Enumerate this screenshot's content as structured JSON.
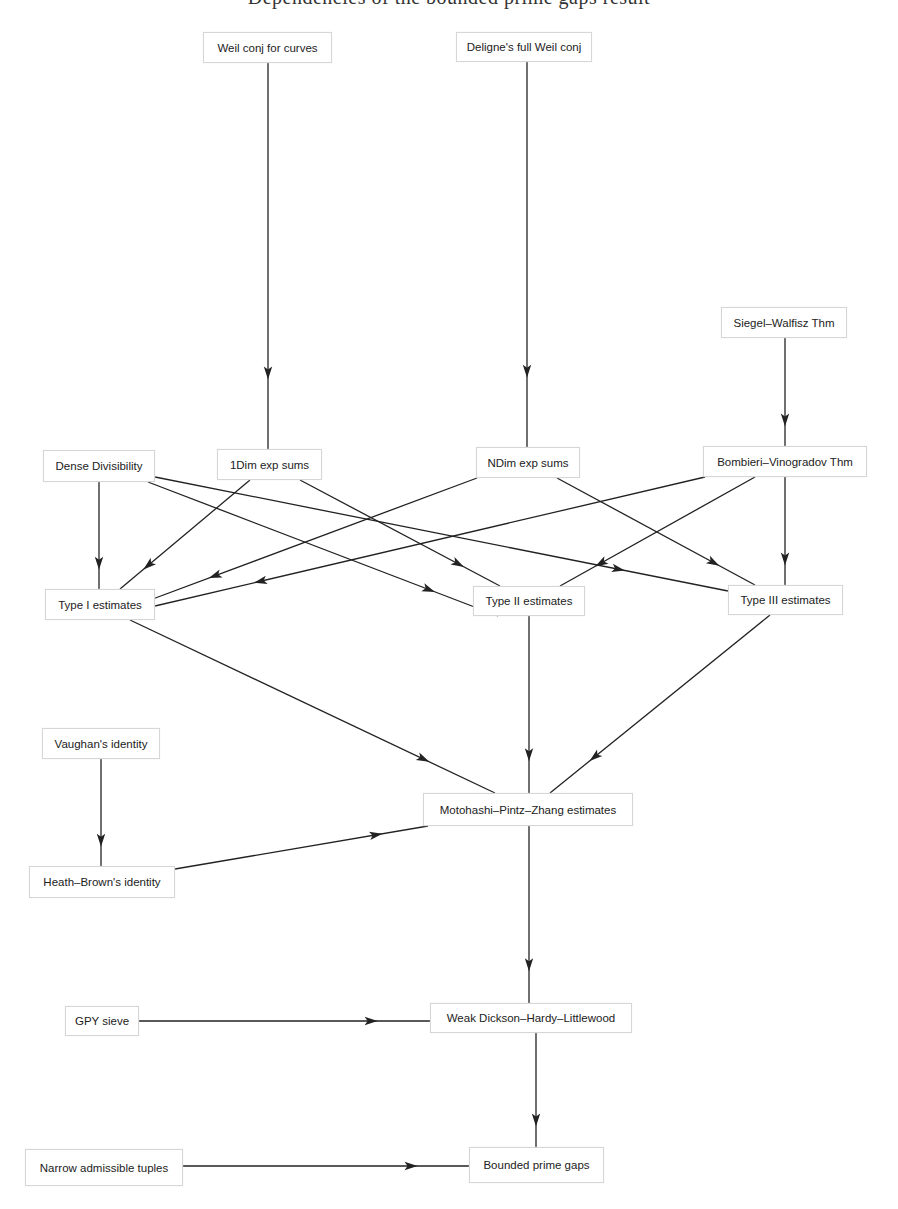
{
  "header": {
    "clipped_title": "Dependencies of the bounded prime gaps result"
  },
  "colors": {
    "edge": "#222222",
    "node_border": "#d6d6d6",
    "text": "#222222"
  },
  "nodes": [
    {
      "id": "weil_curves",
      "label": "Weil conj for curves",
      "x": 203,
      "y": 32,
      "w": 129,
      "h": 31
    },
    {
      "id": "deligne",
      "label": "Deligne's full Weil conj",
      "x": 456,
      "y": 32,
      "w": 136,
      "h": 30
    },
    {
      "id": "siegel",
      "label": "Siegel–Walfisz Thm",
      "x": 721,
      "y": 307,
      "w": 126,
      "h": 31
    },
    {
      "id": "dense",
      "label": "Dense Divisibility",
      "x": 43,
      "y": 450,
      "w": 112,
      "h": 32
    },
    {
      "id": "oned",
      "label": "1Dim exp sums",
      "x": 217,
      "y": 449,
      "w": 105,
      "h": 31
    },
    {
      "id": "nd",
      "label": "NDim exp sums",
      "x": 476,
      "y": 447,
      "w": 104,
      "h": 31
    },
    {
      "id": "bv",
      "label": "Bombieri–Vinogradov Thm",
      "x": 703,
      "y": 446,
      "w": 164,
      "h": 31
    },
    {
      "id": "t1",
      "label": "Type I estimates",
      "x": 45,
      "y": 589,
      "w": 110,
      "h": 31
    },
    {
      "id": "t2",
      "label": "Type II estimates",
      "x": 473,
      "y": 586,
      "w": 112,
      "h": 30
    },
    {
      "id": "t3",
      "label": "Type III estimates",
      "x": 728,
      "y": 585,
      "w": 115,
      "h": 30
    },
    {
      "id": "vaughan",
      "label": "Vaughan's identity",
      "x": 42,
      "y": 728,
      "w": 118,
      "h": 31
    },
    {
      "id": "mpz",
      "label": "Motohashi–Pintz–Zhang estimates",
      "x": 423,
      "y": 793,
      "w": 210,
      "h": 33
    },
    {
      "id": "hb",
      "label": "Heath–Brown's identity",
      "x": 29,
      "y": 866,
      "w": 146,
      "h": 32
    },
    {
      "id": "gpy",
      "label": "GPY sieve",
      "x": 65,
      "y": 1006,
      "w": 74,
      "h": 30
    },
    {
      "id": "dhl",
      "label": "Weak Dickson–Hardy–Littlewood",
      "x": 430,
      "y": 1003,
      "w": 202,
      "h": 30
    },
    {
      "id": "narrow",
      "label": "Narrow admissible tuples",
      "x": 25,
      "y": 1149,
      "w": 158,
      "h": 37
    },
    {
      "id": "bpg",
      "label": "Bounded prime gaps",
      "x": 469,
      "y": 1147,
      "w": 135,
      "h": 36
    }
  ],
  "edges": [
    {
      "from": "weil_curves",
      "to": "oned",
      "x1": 268,
      "y1": 63,
      "x2": 268,
      "y2": 449
    },
    {
      "from": "deligne",
      "to": "nd",
      "x1": 527,
      "y1": 62,
      "x2": 527,
      "y2": 447
    },
    {
      "from": "siegel",
      "to": "bv",
      "x1": 785,
      "y1": 338,
      "x2": 785,
      "y2": 446
    },
    {
      "from": "dense",
      "to": "t1",
      "x1": 99,
      "y1": 482,
      "x2": 99,
      "y2": 589
    },
    {
      "from": "dense",
      "to": "t2",
      "x1": 148,
      "y1": 482,
      "x2": 498,
      "y2": 616
    },
    {
      "from": "dense",
      "to": "t3",
      "x1": 155,
      "y1": 477,
      "x2": 728,
      "y2": 591
    },
    {
      "from": "oned",
      "to": "t1",
      "x1": 250,
      "y1": 480,
      "x2": 120,
      "y2": 589
    },
    {
      "from": "oned",
      "to": "t2",
      "x1": 300,
      "y1": 480,
      "x2": 500,
      "y2": 586
    },
    {
      "from": "nd",
      "to": "t1",
      "x1": 477,
      "y1": 478,
      "x2": 150,
      "y2": 600
    },
    {
      "from": "nd",
      "to": "t3",
      "x1": 557,
      "y1": 478,
      "x2": 755,
      "y2": 585
    },
    {
      "from": "bv",
      "to": "t1",
      "x1": 705,
      "y1": 477,
      "x2": 155,
      "y2": 606
    },
    {
      "from": "bv",
      "to": "t2",
      "x1": 755,
      "y1": 477,
      "x2": 560,
      "y2": 586
    },
    {
      "from": "bv",
      "to": "t3",
      "x1": 785,
      "y1": 477,
      "x2": 785,
      "y2": 585
    },
    {
      "from": "t1",
      "to": "mpz",
      "x1": 130,
      "y1": 620,
      "x2": 495,
      "y2": 793
    },
    {
      "from": "t2",
      "to": "mpz",
      "x1": 529,
      "y1": 616,
      "x2": 529,
      "y2": 793
    },
    {
      "from": "t3",
      "to": "mpz",
      "x1": 770,
      "y1": 615,
      "x2": 550,
      "y2": 793
    },
    {
      "from": "vaughan",
      "to": "hb",
      "x1": 101,
      "y1": 759,
      "x2": 101,
      "y2": 866
    },
    {
      "from": "hb",
      "to": "mpz",
      "x1": 175,
      "y1": 869,
      "x2": 428,
      "y2": 826
    },
    {
      "from": "mpz",
      "to": "dhl",
      "x1": 529,
      "y1": 826,
      "x2": 529,
      "y2": 1003
    },
    {
      "from": "gpy",
      "to": "dhl",
      "x1": 139,
      "y1": 1021,
      "x2": 430,
      "y2": 1021
    },
    {
      "from": "dhl",
      "to": "bpg",
      "x1": 536,
      "y1": 1033,
      "x2": 536,
      "y2": 1147
    },
    {
      "from": "narrow",
      "to": "bpg",
      "x1": 183,
      "y1": 1166,
      "x2": 469,
      "y2": 1166
    }
  ],
  "arrow_position": 0.82
}
